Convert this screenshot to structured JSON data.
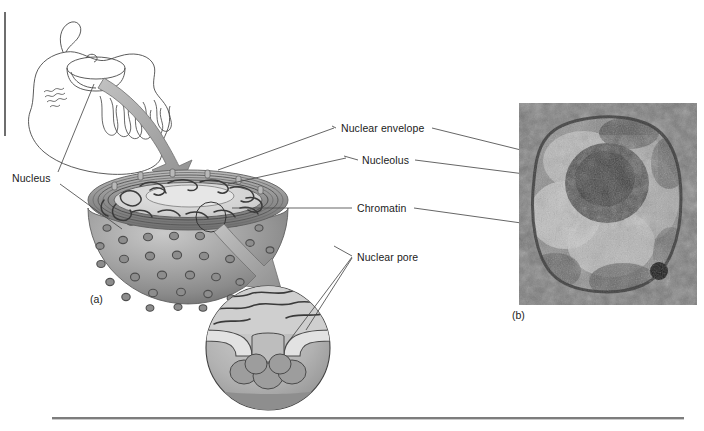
{
  "figure": {
    "title_text": "",
    "panels": [
      {
        "key": "a",
        "label": "(a)"
      },
      {
        "key": "b",
        "label": "(b)"
      }
    ]
  },
  "labels": {
    "nucleus": "Nucleus",
    "nuclear_envelope": "Nuclear envelope",
    "nucleolus": "Nucleolus",
    "chromatin": "Chromatin",
    "nuclear_pore": "Nuclear pore",
    "panel_a": "(a)",
    "panel_b": "(b)"
  },
  "colors": {
    "ink": "#1b1b1b",
    "line": "#4a4a4a",
    "rule": "#7d7d7d",
    "edge_bar": "#6e6e6e",
    "arrow_fill": "#a8a8a8",
    "arrow_stroke": "#6f6f6f",
    "membrane_dark": "#5f5f5f",
    "nucleoplasm_light": "#d8d8d8",
    "sphere_mid": "#9a9a9a",
    "sphere_dark": "#6a6a6a",
    "pore_ring": "#555555",
    "inset_fill": "#b4b4b4",
    "background": "#ffffff"
  },
  "icons": {
    "cell_outline": "cell-outline-icon",
    "er_folds": "endoplasmic-reticulum-icon",
    "curved_arrow": "curved-arrow-icon",
    "magnifier_circle": "magnification-circle-icon"
  }
}
